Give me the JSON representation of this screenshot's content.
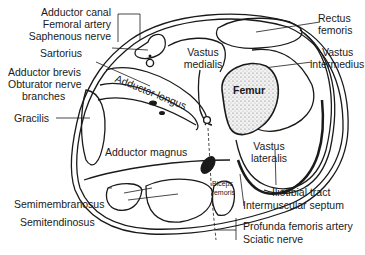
{
  "diagram": {
    "labels": {
      "adductor_canal": "Adductor canal",
      "femoral_artery": "Femoral artery",
      "saphenous_nerve": "Saphenous nerve",
      "sartorius": "Sartorius",
      "adductor_brevis": "Adductor brevis",
      "obturator_nerve": "Obturator nerve",
      "branches": "branches",
      "gracilis": "Gracilis",
      "adductor_longus": "Adductor longus",
      "adductor_magnus": "Adductor magnus",
      "semimembranosus": "Semimembranosus",
      "semitendinosus": "Semitendinosus",
      "rectus": "Rectus",
      "femoris": "femoris",
      "vastus_medialis_1": "Vastus",
      "vastus_medialis_2": "medialis",
      "vastus_intermedius_1": "Vastus",
      "vastus_intermedius_2": "intermedius",
      "femur": "Femur",
      "vastus_lateralis_1": "Vastus",
      "vastus_lateralis_2": "lateralis",
      "biceps_1": "Biceps",
      "biceps_2": "femoris",
      "iliotibial_tract": "Iliotibial tract",
      "intermuscular_septum": "Intermuscular septum",
      "profunda_femoris_artery": "Profunda femoris artery",
      "sciatic_nerve": "Sciatic nerve"
    },
    "colors": {
      "ink": "#1a1a1a",
      "background": "#ffffff",
      "femur_fill": "#e6e6e6"
    }
  }
}
